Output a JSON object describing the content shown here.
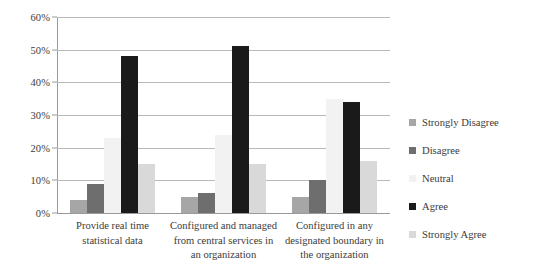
{
  "chart_data": {
    "type": "bar",
    "title": "",
    "subtitle": "",
    "xlabel": "",
    "ylabel": "",
    "ylim": [
      0,
      60
    ],
    "ytick_labels": [
      "0%",
      "10%",
      "20%",
      "30%",
      "40%",
      "50%",
      "60%"
    ],
    "ytick_values": [
      0,
      10,
      20,
      30,
      40,
      50,
      60
    ],
    "grid": true,
    "legend_position": "right",
    "categories": [
      "Provide real time statistical data",
      "Configured and managed from central services in an organization",
      "Configured in any designated boundary in the organization"
    ],
    "category_lines": [
      [
        "Provide real time",
        "statistical data"
      ],
      [
        "Configured and managed",
        "from central services in",
        "an organization"
      ],
      [
        "Configured in any",
        "designated boundary in",
        "the organization"
      ]
    ],
    "series": [
      {
        "name": "Strongly Disagree",
        "color": "#a6a6a6",
        "values": [
          4,
          5,
          5
        ]
      },
      {
        "name": "Disagree",
        "color": "#6e6e6e",
        "values": [
          9,
          6,
          10
        ]
      },
      {
        "name": "Neutral",
        "color": "#f2f2f2",
        "values": [
          23,
          24,
          35
        ]
      },
      {
        "name": "Agree",
        "color": "#1a1a1a",
        "values": [
          48,
          51,
          34
        ]
      },
      {
        "name": "Strongly Agree",
        "color": "#d9d9d9",
        "values": [
          15,
          15,
          16
        ]
      }
    ]
  },
  "legend": {
    "items": [
      {
        "label": "Strongly Disagree",
        "color": "#a6a6a6"
      },
      {
        "label": "Disagree",
        "color": "#6e6e6e"
      },
      {
        "label": "Neutral",
        "color": "#f2f2f2"
      },
      {
        "label": "Agree",
        "color": "#1a1a1a"
      },
      {
        "label": "Strongly Agree",
        "color": "#d9d9d9"
      }
    ]
  }
}
